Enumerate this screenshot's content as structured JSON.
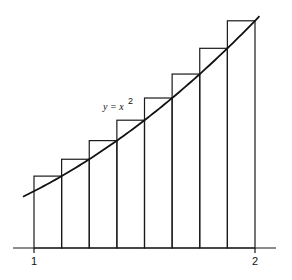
{
  "chart_data": {
    "type": "riemann-sum",
    "function": "y = x^2",
    "curve_label": {
      "prefix": "y = x",
      "exponent": "2"
    },
    "interval": [
      1,
      2
    ],
    "n_subintervals": 8,
    "endpoint_rule": "right",
    "partition": [
      1,
      1.125,
      1.25,
      1.375,
      1.5,
      1.625,
      1.75,
      1.875,
      2
    ],
    "rectangle_heights": [
      1.265625,
      1.5625,
      1.890625,
      2.25,
      2.640625,
      3.0625,
      3.515625,
      4
    ],
    "curve_domain": [
      0.95,
      2.02
    ],
    "xlim": [
      0.9,
      2.1
    ],
    "ylim": [
      0,
      4.3
    ],
    "x_tick_labels": [
      "1",
      "2"
    ],
    "x_tick_values": [
      1,
      2
    ],
    "grid": false
  }
}
